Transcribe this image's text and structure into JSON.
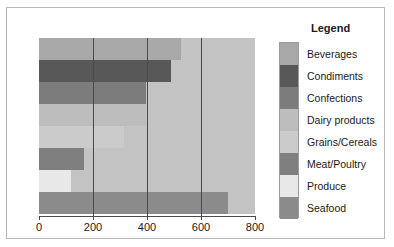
{
  "chart_data": {
    "type": "bar",
    "orientation": "horizontal",
    "title": "",
    "xlabel": "",
    "ylabel": "",
    "xlim": [
      0,
      800
    ],
    "xticks": [
      0,
      200,
      400,
      600,
      800
    ],
    "xticklabels": [
      "0",
      "200",
      "400",
      "600",
      "800"
    ],
    "grid": true,
    "grid_axis": "x",
    "legend_title": "Legend",
    "legend_position": "right",
    "categories": [
      "Beverages",
      "Condiments",
      "Confections",
      "Dairy products",
      "Grains/Cereals",
      "Meat/Poultry",
      "Produce",
      "Seafood"
    ],
    "values": [
      525,
      490,
      395,
      395,
      315,
      165,
      120,
      700
    ],
    "colors": [
      "#a8a8a8",
      "#585858",
      "#7c7c7c",
      "#bdbdbd",
      "#cbcbcb",
      "#7f7f7f",
      "#e8e8e8",
      "#8b8b8b"
    ],
    "track_color": "#c3c3c3",
    "axis_color": "#4a4a4a",
    "frame_color": "#b9b9b9"
  },
  "legend": {
    "title": "Legend",
    "items": [
      {
        "label": "Beverages",
        "color": "#a8a8a8"
      },
      {
        "label": "Condiments",
        "color": "#585858"
      },
      {
        "label": "Confections",
        "color": "#7c7c7c"
      },
      {
        "label": "Dairy products",
        "color": "#bdbdbd"
      },
      {
        "label": "Grains/Cereals",
        "color": "#cbcbcb"
      },
      {
        "label": "Meat/Poultry",
        "color": "#7f7f7f"
      },
      {
        "label": "Produce",
        "color": "#e8e8e8"
      },
      {
        "label": "Seafood",
        "color": "#8b8b8b"
      }
    ]
  }
}
